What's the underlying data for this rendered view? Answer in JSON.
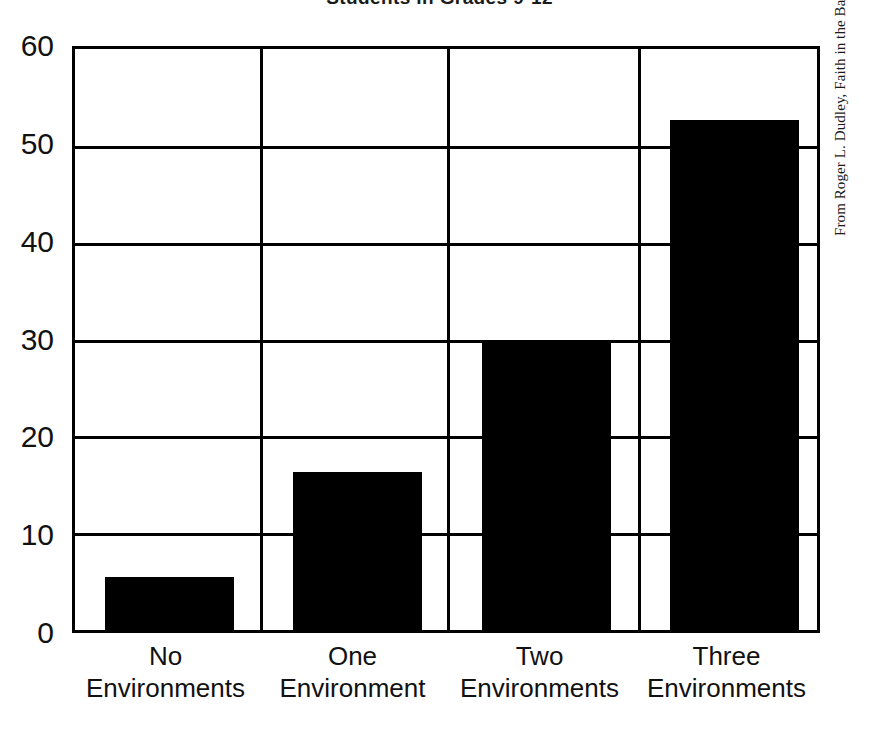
{
  "chart_data": {
    "type": "bar",
    "title": "Students in Grades 9-12",
    "categories": [
      "No Environments",
      "One Environment",
      "Two Environments",
      "Three Environments"
    ],
    "category_lines": [
      [
        "No",
        "Environments"
      ],
      [
        "One",
        "Environment"
      ],
      [
        "Two",
        "Environments"
      ],
      [
        "Three",
        "Environments"
      ]
    ],
    "values": [
      5.5,
      16.3,
      30,
      52.7
    ],
    "xlabel": "",
    "ylabel": "",
    "ylim": [
      0,
      60
    ],
    "yticks": [
      0,
      10,
      20,
      30,
      40,
      50,
      60
    ],
    "ytick_labels": [
      "0",
      "10",
      "20",
      "30",
      "40",
      "50",
      "60"
    ],
    "grid": "horizontal-and-vertical",
    "legend": "none",
    "bar_color": "#000000",
    "background_color": "#ffffff"
  },
  "source_credit": "From Roger L. Dudley, Faith in the Balance, p. 295",
  "colors": {
    "bar": "#000000",
    "axis": "#000000",
    "background": "#ffffff",
    "text": "#111111"
  }
}
